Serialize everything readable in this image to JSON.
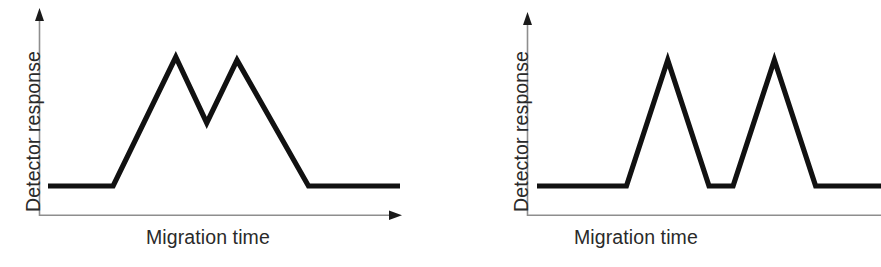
{
  "figure": {
    "background_color": "#ffffff",
    "trace_color": "#111111",
    "axis_color": "#8e8e8e",
    "label_color": "#2a2a2a"
  },
  "panels": [
    {
      "id": "left",
      "name": "low-efficiency-trace",
      "ylabel": "Detector response",
      "xlabel": "Migration time",
      "y_axis_arrow": "up",
      "x_axis_arrow": "right",
      "peak_count": 2,
      "resolution": "partially resolved"
    },
    {
      "id": "right",
      "name": "high-efficiency-trace",
      "ylabel": "Detector response",
      "xlabel": "Migration time",
      "y_axis_arrow": "up",
      "x_axis_arrow": "right",
      "peak_count": 2,
      "resolution": "baseline resolved"
    }
  ],
  "chart_data": [
    {
      "type": "line",
      "name": "left-panel-broad-peaks",
      "title": "",
      "xlabel": "Migration time",
      "ylabel": "Detector response",
      "xlim": [
        0,
        100
      ],
      "ylim": [
        0,
        100
      ],
      "grid": false,
      "legend": "none",
      "tick_labels": {
        "x": [],
        "y": []
      },
      "annotations": [],
      "series": [
        {
          "name": "detector signal",
          "comment": "Two broad overlapping triangular peaks; valley does not return to baseline",
          "x": [
            0.0,
            18.5,
            36.3,
            45.1,
            53.7,
            74.0,
            100.0
          ],
          "y": [
            6.0,
            6.0,
            100.0,
            52.0,
            97.7,
            6.0,
            6.0
          ]
        }
      ]
    },
    {
      "type": "line",
      "name": "right-panel-sharp-peaks",
      "title": "",
      "xlabel": "Migration time",
      "ylabel": "Detector response",
      "xlim": [
        0,
        100
      ],
      "ylim": [
        0,
        100
      ],
      "grid": false,
      "legend": "none",
      "tick_labels": {
        "x": [],
        "y": []
      },
      "annotations": [],
      "series": [
        {
          "name": "detector signal",
          "comment": "Two narrow sharp peaks of equal height returning fully to baseline between them",
          "x": [
            0.0,
            26.0,
            38.0,
            50.0,
            57.0,
            69.0,
            81.0,
            100.0
          ],
          "y": [
            6.0,
            6.0,
            97.7,
            6.0,
            6.0,
            97.7,
            6.0,
            6.0
          ]
        }
      ]
    }
  ]
}
